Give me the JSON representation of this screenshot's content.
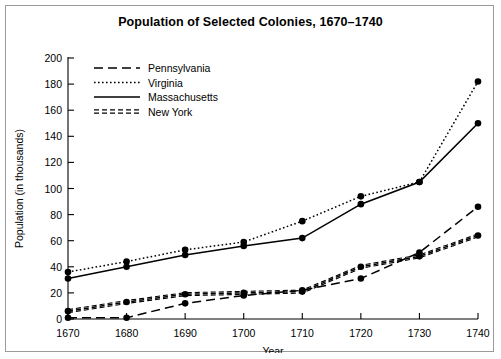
{
  "chart_data": {
    "type": "line",
    "title": "Population of Selected Colonies, 1670–1740",
    "xlabel": "Year",
    "ylabel": "Population (in thousands)",
    "x": [
      1670,
      1680,
      1690,
      1700,
      1710,
      1720,
      1730,
      1740
    ],
    "xtick_labels": [
      "1670",
      "1680",
      "1690",
      "1700",
      "1710",
      "1720",
      "1730",
      "1740"
    ],
    "ytick_labels": [
      "0",
      "20",
      "40",
      "60",
      "80",
      "100",
      "120",
      "140",
      "160",
      "180",
      "200"
    ],
    "yticks": [
      0,
      20,
      40,
      60,
      80,
      100,
      120,
      140,
      160,
      180,
      200
    ],
    "xlim": [
      1670,
      1740
    ],
    "ylim": [
      0,
      200
    ],
    "grid": false,
    "legend_position": "upper left",
    "markers": "filled-circle",
    "color": "#000000",
    "series": [
      {
        "name": "Pennsylvania",
        "style": "long-dash",
        "dasharray": "9,5",
        "values": [
          1,
          1,
          12,
          18,
          22,
          31,
          51,
          86
        ]
      },
      {
        "name": "Virginia",
        "style": "dotted",
        "dasharray": "1.6,2.4",
        "values": [
          36,
          44,
          53,
          59,
          75,
          94,
          105,
          182
        ]
      },
      {
        "name": "Massachusetts",
        "style": "solid",
        "dasharray": "",
        "values": [
          31,
          40,
          49,
          56,
          62,
          88,
          105,
          150
        ]
      },
      {
        "name": "New York",
        "style": "double-dash",
        "dasharray": "5,3",
        "values": [
          6,
          13,
          19,
          20,
          21,
          40,
          48,
          64
        ]
      }
    ]
  }
}
